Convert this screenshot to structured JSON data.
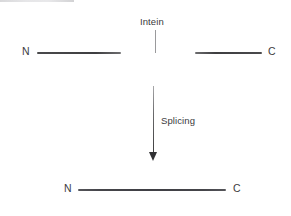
{
  "figure": {
    "background_color": "#ffffff"
  },
  "precursor": {
    "n_terminus_label": "N",
    "c_terminus_label": "C",
    "intein_label": "Intein",
    "extein_color": "#3e3e40",
    "intein_color": "#e6e6e8",
    "leader_color": "#9a9a9c"
  },
  "transition": {
    "arrow_label": "Splicing",
    "arrow_color": "#3c3c3e",
    "direction": "down"
  },
  "product": {
    "n_terminus_label": "N",
    "c_terminus_label": "C",
    "line_color": "#3f3f44"
  },
  "chart_data": {
    "type": "diagram",
    "elements": [
      {
        "name": "precursor-protein",
        "shape": "horizontal-line",
        "y": 52,
        "x_start": 37,
        "x_end": 262,
        "segments": [
          {
            "name": "N-extein",
            "x_start": 37,
            "x_end": 121,
            "color": "#3e3e40"
          },
          {
            "name": "intein",
            "x_start": 121,
            "x_end": 195,
            "color": "#e6e6e8"
          },
          {
            "name": "C-extein",
            "x_start": 195,
            "x_end": 262,
            "color": "#3e3e40"
          }
        ],
        "labels": [
          {
            "text": "N",
            "x": 25,
            "y": 52
          },
          {
            "text": "C",
            "x": 270,
            "y": 52
          },
          {
            "text": "Intein",
            "x": 156,
            "y": 22,
            "leader_to": {
              "x": 155,
              "y": 52
            }
          }
        ]
      },
      {
        "name": "splicing-arrow",
        "shape": "arrow",
        "x": 153,
        "y_start": 86,
        "y_end": 161,
        "label": "Splicing",
        "label_x": 161,
        "label_y": 122
      },
      {
        "name": "spliced-product-protein",
        "shape": "horizontal-line",
        "y": 189,
        "x_start": 78,
        "x_end": 226,
        "color": "#3f3f44",
        "labels": [
          {
            "text": "N",
            "x": 67,
            "y": 189
          },
          {
            "text": "C",
            "x": 236,
            "y": 189
          }
        ]
      }
    ]
  }
}
